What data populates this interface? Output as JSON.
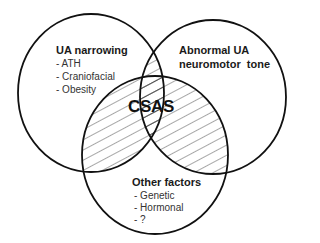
{
  "diagram": {
    "type": "venn",
    "center_label": "CSAS",
    "sets": [
      {
        "id": "ua-narrowing",
        "title": "UA narrowing",
        "items": [
          "- ATH",
          "- Craniofacial",
          "- Obesity"
        ]
      },
      {
        "id": "abnormal-ua-neuromotor-tone",
        "title_lines": [
          "Abnormal UA",
          "neuromotor  tone"
        ],
        "items": []
      },
      {
        "id": "other-factors",
        "title": "Other factors",
        "items": [
          "- Genetic",
          "- Hormonal",
          "- ?"
        ]
      }
    ],
    "colors": {
      "stroke": "#111111",
      "hatch": "#222222",
      "background": "#ffffff"
    }
  }
}
